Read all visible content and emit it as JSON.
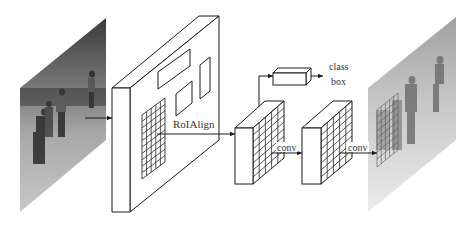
{
  "diagram": {
    "title": "",
    "type": "neural-network-architecture",
    "nodes": [
      {
        "id": "input-image",
        "kind": "image",
        "description": "input photo of children playing soccer"
      },
      {
        "id": "feature-map",
        "kind": "3d-block",
        "description": "backbone feature map with RoI boxes and grid"
      },
      {
        "id": "roi-block",
        "kind": "3d-block",
        "description": "RoI feature (grid)"
      },
      {
        "id": "fc-head",
        "kind": "3d-box",
        "description": "class/box head"
      },
      {
        "id": "conv-block",
        "kind": "3d-block",
        "description": "conv feature (grid)"
      },
      {
        "id": "output-image",
        "kind": "image",
        "description": "output mask overlay on image"
      }
    ],
    "edges": [
      {
        "from": "input-image",
        "to": "feature-map",
        "label": ""
      },
      {
        "from": "feature-map",
        "to": "roi-block",
        "label": "RoIAlign"
      },
      {
        "from": "roi-block",
        "to": "fc-head",
        "label": ""
      },
      {
        "from": "roi-block",
        "to": "conv-block",
        "label": "conv"
      },
      {
        "from": "conv-block",
        "to": "output-image",
        "label": "conv"
      }
    ]
  },
  "labels": {
    "roialign": "RoIAlign",
    "conv_1": "conv",
    "conv_2": "conv",
    "class": "class",
    "box": "box"
  },
  "colors": {
    "line": "#1a1a1a",
    "text": "#333333",
    "background": "#ffffff"
  }
}
